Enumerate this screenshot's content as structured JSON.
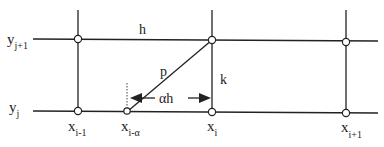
{
  "diagram": {
    "grid_labels": {
      "y_upper": {
        "base": "y",
        "sub": "j+1"
      },
      "y_lower": {
        "base": "y",
        "sub": "j"
      },
      "x_left": {
        "base": "x",
        "sub": "i-1"
      },
      "x_foot": {
        "base": "x",
        "sub": "i-α"
      },
      "x_mid": {
        "base": "x",
        "sub": "i"
      },
      "x_right": {
        "base": "x",
        "sub": "i+1"
      }
    },
    "segment_labels": {
      "h": "h",
      "p": "p",
      "k": "k",
      "alpha_h": "αh"
    },
    "colors": {
      "line": "#222222",
      "background": "#ffffff"
    }
  }
}
